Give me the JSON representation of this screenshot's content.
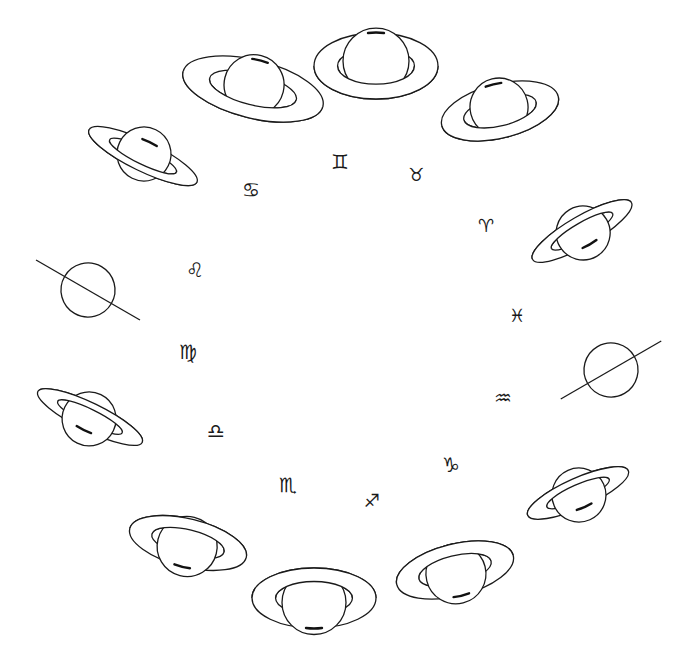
{
  "diagram": {
    "title": "",
    "stroke_color": "#1a1a1a",
    "background": "#ffffff"
  },
  "zodiac": [
    {
      "name": "gemini",
      "glyph": "♊",
      "x": 340,
      "y": 162,
      "size": 20
    },
    {
      "name": "taurus",
      "glyph": "♉",
      "x": 416,
      "y": 175,
      "size": 18
    },
    {
      "name": "aries",
      "glyph": "♈",
      "x": 486,
      "y": 226,
      "size": 18
    },
    {
      "name": "pisces",
      "glyph": "♓",
      "x": 517,
      "y": 316,
      "size": 18
    },
    {
      "name": "aquarius",
      "glyph": "♒",
      "x": 503,
      "y": 398,
      "size": 20
    },
    {
      "name": "capricorn",
      "glyph": "♑",
      "x": 451,
      "y": 465,
      "size": 20
    },
    {
      "name": "sagittarius",
      "glyph": "♐",
      "x": 372,
      "y": 501,
      "size": 18
    },
    {
      "name": "scorpio",
      "glyph": "♏",
      "x": 288,
      "y": 485,
      "size": 20
    },
    {
      "name": "libra",
      "glyph": "♎",
      "x": 216,
      "y": 431,
      "size": 20
    },
    {
      "name": "virgo",
      "glyph": "♍",
      "x": 188,
      "y": 352,
      "size": 20
    },
    {
      "name": "leo",
      "glyph": "♌",
      "x": 195,
      "y": 270,
      "size": 20
    },
    {
      "name": "cancer",
      "glyph": "♋",
      "x": 251,
      "y": 190,
      "size": 20
    }
  ],
  "saturns": [
    {
      "id": "top-left",
      "cx": 253,
      "cy": 89,
      "rx": 72,
      "ry": 29,
      "angle": 14,
      "r": 30,
      "type": "ringed",
      "side": "below"
    },
    {
      "id": "top",
      "cx": 376,
      "cy": 66,
      "rx": 62,
      "ry": 33,
      "angle": 0,
      "r": 33,
      "type": "ringed",
      "side": "below"
    },
    {
      "id": "top-right",
      "cx": 500,
      "cy": 111,
      "rx": 60,
      "ry": 27,
      "angle": -14,
      "r": 29,
      "type": "ringed",
      "side": "below"
    },
    {
      "id": "right-upper",
      "cx": 582,
      "cy": 231,
      "rx": 57,
      "ry": 15,
      "angle": -30,
      "r": 27,
      "type": "ringed",
      "side": "above"
    },
    {
      "id": "right-edge-on",
      "cx": 611,
      "cy": 370,
      "rx": 58,
      "ry": 0,
      "angle": -30,
      "r": 27,
      "type": "edge"
    },
    {
      "id": "right-lower",
      "cx": 578,
      "cy": 493,
      "rx": 55,
      "ry": 15,
      "angle": -24,
      "r": 27,
      "type": "ringed",
      "side": "above"
    },
    {
      "id": "bottom-right",
      "cx": 455,
      "cy": 570,
      "rx": 60,
      "ry": 26,
      "angle": -14,
      "r": 30,
      "type": "ringed",
      "side": "above"
    },
    {
      "id": "bottom",
      "cx": 314,
      "cy": 598,
      "rx": 62,
      "ry": 30,
      "angle": 0,
      "r": 32,
      "type": "ringed",
      "side": "above"
    },
    {
      "id": "bottom-left",
      "cx": 188,
      "cy": 543,
      "rx": 60,
      "ry": 24,
      "angle": 14,
      "r": 30,
      "type": "ringed",
      "side": "above"
    },
    {
      "id": "left-lower",
      "cx": 90,
      "cy": 417,
      "rx": 58,
      "ry": 14,
      "angle": 26,
      "r": 27,
      "type": "ringed",
      "side": "above"
    },
    {
      "id": "left-edge-on",
      "cx": 88,
      "cy": 290,
      "rx": 60,
      "ry": 0,
      "angle": 30,
      "r": 27,
      "type": "edge"
    },
    {
      "id": "left-upper",
      "cx": 143,
      "cy": 156,
      "rx": 60,
      "ry": 15,
      "angle": 26,
      "r": 27,
      "type": "ringed",
      "side": "below"
    }
  ]
}
